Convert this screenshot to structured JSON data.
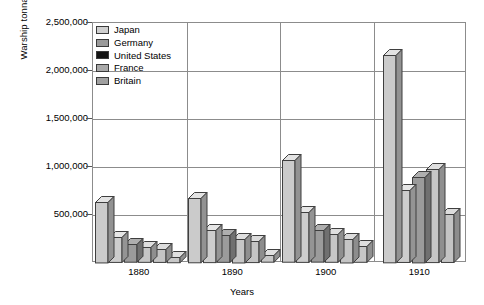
{
  "chart_data": {
    "type": "bar",
    "title": "",
    "xlabel": "Years",
    "ylabel": "Warship tonnage",
    "categories": [
      "1880",
      "1890",
      "1900",
      "1910"
    ],
    "ylim": [
      0,
      2500000
    ],
    "ytick_values": [
      500000,
      1000000,
      1500000,
      2000000,
      2500000
    ],
    "ytick_labels": [
      "500,000",
      "1,000,000",
      "1,500,000",
      "2,000,000",
      "2,500,000"
    ],
    "grid": true,
    "legend_position": "top-left",
    "style": "3d-bar",
    "series": [
      {
        "name": "Britain",
        "color": "#c9c9c9",
        "values": [
          640000,
          680000,
          1070000,
          2170000
        ]
      },
      {
        "name": "Japan",
        "color": "#cdcdcd",
        "values": [
          270000,
          340000,
          530000,
          760000
        ]
      },
      {
        "name": "Germany",
        "color": "#9a9a9a",
        "values": [
          190000,
          290000,
          330000,
          900000
        ]
      },
      {
        "name": "United States",
        "color": "#141414",
        "values": [
          165000,
          255000,
          300000,
          0
        ]
      },
      {
        "name": "France",
        "color": "#c4c4c4",
        "values": [
          145000,
          230000,
          250000,
          980000
        ]
      },
      {
        "name": "Britain2",
        "color": "#c7c7c7",
        "values": [
          60000,
          75000,
          170000,
          510000
        ]
      }
    ],
    "legend_entries": [
      {
        "label": "Japan",
        "color": "#cfcfcf"
      },
      {
        "label": "Germany",
        "color": "#9a9a9a"
      },
      {
        "label": "United States",
        "color": "#141414"
      },
      {
        "label": "France",
        "color": "#a8a8a8"
      },
      {
        "label": "Britain",
        "color": "#a0a0a0"
      }
    ],
    "groups": [
      {
        "category": "1880",
        "bars": [
          {
            "series": "Britain",
            "value": 640000,
            "color": "#cbcbcb"
          },
          {
            "series": "Japan",
            "value": 270000,
            "color": "#cdcdcd"
          },
          {
            "series": "Germany",
            "value": 195000,
            "color": "#9b9b9b"
          },
          {
            "series": "United States",
            "value": 165000,
            "color": "#c6c6c6"
          },
          {
            "series": "France",
            "value": 145000,
            "color": "#c4c4c4"
          },
          {
            "series": "Britain",
            "value": 65000,
            "color": "#c7c7c7"
          }
        ]
      },
      {
        "category": "1890",
        "bars": [
          {
            "series": "Britain",
            "value": 680000,
            "color": "#cbcbcb"
          },
          {
            "series": "Japan",
            "value": 345000,
            "color": "#cdcdcd"
          },
          {
            "series": "Germany",
            "value": 290000,
            "color": "#9b9b9b"
          },
          {
            "series": "United States",
            "value": 255000,
            "color": "#c6c6c6"
          },
          {
            "series": "France",
            "value": 230000,
            "color": "#c4c4c4"
          },
          {
            "series": "Britain",
            "value": 80000,
            "color": "#c7c7c7"
          }
        ]
      },
      {
        "category": "1900",
        "bars": [
          {
            "series": "Britain",
            "value": 1070000,
            "color": "#cbcbcb"
          },
          {
            "series": "Japan",
            "value": 530000,
            "color": "#cdcdcd"
          },
          {
            "series": "Germany",
            "value": 340000,
            "color": "#9b9b9b"
          },
          {
            "series": "United States",
            "value": 300000,
            "color": "#c6c6c6"
          },
          {
            "series": "France",
            "value": 255000,
            "color": "#c4c4c4"
          },
          {
            "series": "Britain",
            "value": 175000,
            "color": "#c7c7c7"
          }
        ]
      },
      {
        "category": "1910",
        "bars": [
          {
            "series": "Britain",
            "value": 2170000,
            "color": "#cbcbcb"
          },
          {
            "series": "Japan",
            "value": 760000,
            "color": "#cdcdcd"
          },
          {
            "series": "Germany",
            "value": 900000,
            "color": "#9b9b9b"
          },
          {
            "series": "United States",
            "value": 980000,
            "color": "#c6c6c6"
          },
          {
            "series": "France",
            "value": 510000,
            "color": "#c4c4c4"
          }
        ]
      }
    ]
  },
  "axis": {
    "y_title": "Warship tonnage",
    "x_title": "Years"
  }
}
